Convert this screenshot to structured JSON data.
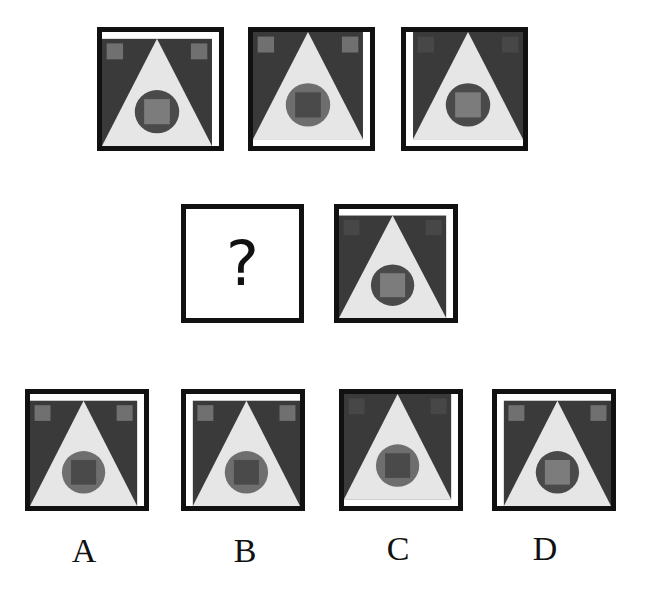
{
  "colors": {
    "border": "#111111",
    "background_dark": "#3a3a3a",
    "triangle": "#e6e6e6",
    "circle_dark": "#4a4a4a",
    "circle_mid": "#6e6e6e",
    "inner_light": "#7c7c7c",
    "inner_dark": "#4a4a4a",
    "corner_light": "#707070",
    "corner_faint": "#474747"
  },
  "question_mark": "?",
  "figures": {
    "row1": [
      {
        "id": "fig1",
        "white_strip": [
          "top",
          "right"
        ],
        "circle": "dark",
        "inner_square": "light",
        "corner_squares": "light"
      },
      {
        "id": "fig2",
        "white_strip": [
          "right",
          "bottom"
        ],
        "circle": "mid",
        "inner_square": "dark",
        "corner_squares": "light"
      },
      {
        "id": "fig3",
        "white_strip": [
          "left",
          "bottom"
        ],
        "circle": "dark",
        "inner_square": "light",
        "corner_squares": "faint"
      }
    ],
    "row2": [
      {
        "id": "fig4",
        "unknown": true
      },
      {
        "id": "fig5",
        "white_strip": [
          "top",
          "right"
        ],
        "circle": "dark",
        "inner_square": "light",
        "corner_squares": "faint"
      }
    ]
  },
  "options": [
    {
      "label": "A",
      "white_strip": [
        "top",
        "right"
      ],
      "circle": "mid",
      "inner_square": "dark",
      "corner_squares": "light"
    },
    {
      "label": "B",
      "white_strip": [
        "top",
        "left"
      ],
      "circle": "mid",
      "inner_square": "dark",
      "corner_squares": "light"
    },
    {
      "label": "C",
      "white_strip": [
        "right",
        "bottom"
      ],
      "circle": "mid",
      "inner_square": "dark",
      "corner_squares": "faint"
    },
    {
      "label": "D",
      "white_strip": [
        "top",
        "left"
      ],
      "circle": "dark",
      "inner_square": "light",
      "corner_squares": "light"
    }
  ]
}
